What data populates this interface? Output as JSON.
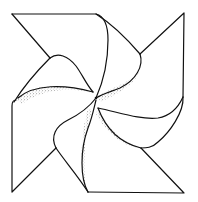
{
  "figure": {
    "subject": "pinwheel line drawing",
    "colors": {
      "background": "#ffffff",
      "line": "#111111",
      "stipple": "#333333"
    }
  }
}
